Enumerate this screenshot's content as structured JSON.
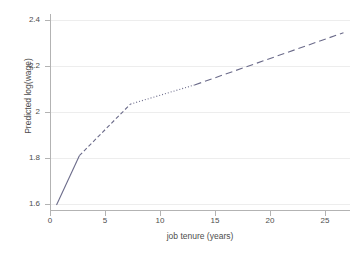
{
  "chart_data": {
    "type": "line",
    "title": "",
    "subtitle": "",
    "xlabel": "job tenure (years)",
    "ylabel": "Predicted log(wage)",
    "xlim": [
      -0.4,
      27.2
    ],
    "ylim": [
      1.53,
      2.45
    ],
    "grid": "horizontal",
    "legend": "none",
    "xticks": [
      0,
      5,
      10,
      15,
      20,
      25
    ],
    "xtick_labels": [
      "0",
      "5",
      "10",
      "15",
      "20",
      "25"
    ],
    "yticks": [
      1.6,
      1.8,
      2.0,
      2.2,
      2.4
    ],
    "ytick_labels": [
      "1.6",
      "1.8",
      "2",
      "2.2",
      "2.4"
    ],
    "colors": {
      "line": "#6b6b8a",
      "axis": "#b3b3b3",
      "grid": "#ededed",
      "text": "#4d4d4d",
      "background": "#ffffff"
    },
    "series": [
      {
        "name": "predicted log(wage) spline",
        "style": "piecewise",
        "x": [
          0.2,
          2.3,
          7.0,
          12.9,
          26.6
        ],
        "y": [
          1.553,
          1.785,
          2.027,
          2.117,
          2.362
        ],
        "segments": [
          {
            "label": "segment-1-solid",
            "dash": "solid",
            "x0": 0.2,
            "y0": 1.553,
            "x1": 2.3,
            "y1": 1.785
          },
          {
            "label": "segment-2-shortdash",
            "dash": "short-dash",
            "x0": 2.3,
            "y0": 1.785,
            "x1": 7.0,
            "y1": 2.027
          },
          {
            "label": "segment-3-dotted",
            "dash": "dotted",
            "x0": 7.0,
            "y0": 2.027,
            "x1": 12.9,
            "y1": 2.117
          },
          {
            "label": "segment-4-longdash",
            "dash": "long-dash",
            "x0": 12.9,
            "y0": 2.117,
            "x1": 26.6,
            "y1": 2.362
          }
        ]
      }
    ]
  }
}
